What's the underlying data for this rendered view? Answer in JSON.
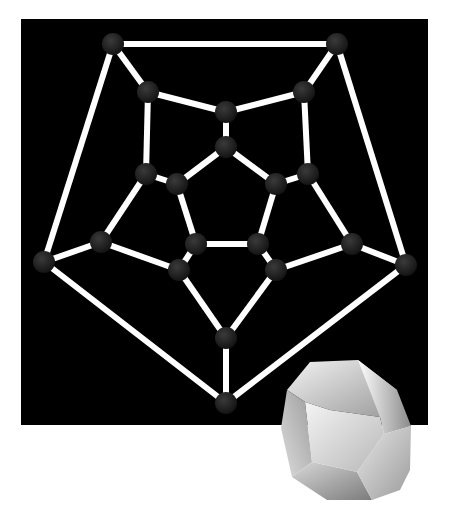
{
  "figure": {
    "title": "",
    "background_panel_color": "#000000",
    "edge_color": "#ffffff",
    "node_color": "#1a1a1a",
    "node_radius": 11,
    "edge_width": 6
  },
  "graph": {
    "nodes": [
      {
        "id": "A",
        "x": 113,
        "y": 44
      },
      {
        "id": "B",
        "x": 337,
        "y": 44
      },
      {
        "id": "C",
        "x": 44,
        "y": 262
      },
      {
        "id": "D",
        "x": 406,
        "y": 265
      },
      {
        "id": "E",
        "x": 226,
        "y": 403
      },
      {
        "id": "F",
        "x": 148,
        "y": 92
      },
      {
        "id": "G",
        "x": 304,
        "y": 92
      },
      {
        "id": "H",
        "x": 226,
        "y": 112
      },
      {
        "id": "I",
        "x": 226,
        "y": 147
      },
      {
        "id": "J",
        "x": 146,
        "y": 174
      },
      {
        "id": "K",
        "x": 177,
        "y": 184
      },
      {
        "id": "L",
        "x": 276,
        "y": 184
      },
      {
        "id": "M",
        "x": 308,
        "y": 174
      },
      {
        "id": "N",
        "x": 101,
        "y": 242
      },
      {
        "id": "O",
        "x": 196,
        "y": 244
      },
      {
        "id": "P",
        "x": 258,
        "y": 244
      },
      {
        "id": "Q",
        "x": 352,
        "y": 244
      },
      {
        "id": "R",
        "x": 179,
        "y": 270
      },
      {
        "id": "S",
        "x": 276,
        "y": 270
      },
      {
        "id": "T",
        "x": 226,
        "y": 338
      }
    ],
    "edges": [
      [
        "A",
        "B"
      ],
      [
        "A",
        "C"
      ],
      [
        "A",
        "F"
      ],
      [
        "B",
        "D"
      ],
      [
        "B",
        "G"
      ],
      [
        "C",
        "N"
      ],
      [
        "C",
        "E"
      ],
      [
        "D",
        "Q"
      ],
      [
        "D",
        "E"
      ],
      [
        "E",
        "T"
      ],
      [
        "F",
        "H"
      ],
      [
        "F",
        "J"
      ],
      [
        "G",
        "H"
      ],
      [
        "G",
        "M"
      ],
      [
        "H",
        "I"
      ],
      [
        "I",
        "K"
      ],
      [
        "I",
        "L"
      ],
      [
        "J",
        "K"
      ],
      [
        "J",
        "N"
      ],
      [
        "K",
        "O"
      ],
      [
        "L",
        "M"
      ],
      [
        "L",
        "P"
      ],
      [
        "M",
        "Q"
      ],
      [
        "N",
        "R"
      ],
      [
        "O",
        "P"
      ],
      [
        "O",
        "R"
      ],
      [
        "P",
        "S"
      ],
      [
        "Q",
        "S"
      ],
      [
        "R",
        "T"
      ],
      [
        "S",
        "T"
      ]
    ]
  },
  "solid": {
    "name": "dodecahedron",
    "center": {
      "x": 344,
      "y": 444
    }
  }
}
